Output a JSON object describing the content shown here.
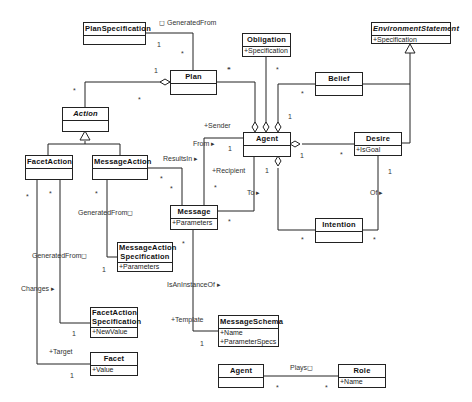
{
  "diagram": {
    "type": "UML class diagram",
    "classes": [
      {
        "id": "planspec",
        "name": "PlanSpecification",
        "attributes": [],
        "abstract": false
      },
      {
        "id": "plan",
        "name": "Plan",
        "attributes": [],
        "abstract": false
      },
      {
        "id": "obligation",
        "name": "Obligation",
        "attributes": [
          "+Specification"
        ],
        "abstract": false
      },
      {
        "id": "envstatement",
        "name": "EnvironmentStatement",
        "attributes": [
          "+Specification"
        ],
        "abstract": true
      },
      {
        "id": "action",
        "name": "Action",
        "attributes": [],
        "abstract": true
      },
      {
        "id": "belief",
        "name": "Belief",
        "attributes": [],
        "abstract": false
      },
      {
        "id": "agent",
        "name": "Agent",
        "attributes": [],
        "abstract": false
      },
      {
        "id": "desire",
        "name": "Desire",
        "attributes": [
          "+IsGoal"
        ],
        "abstract": false
      },
      {
        "id": "facetaction",
        "name": "FacetAction",
        "attributes": [],
        "abstract": false
      },
      {
        "id": "messageaction",
        "name": "MessageAction",
        "attributes": [],
        "abstract": false
      },
      {
        "id": "message",
        "name": "Message",
        "attributes": [
          "+Parameters"
        ],
        "abstract": false
      },
      {
        "id": "intention",
        "name": "Intention",
        "attributes": [],
        "abstract": false
      },
      {
        "id": "msgactionspec",
        "name": "MessageAction Specification",
        "name_lines": [
          "MessageAction",
          "Specification"
        ],
        "attributes": [
          "+Parameters"
        ],
        "abstract": false
      },
      {
        "id": "facetactionspec",
        "name": "FacetAction Specification",
        "name_lines": [
          "FacetAction",
          "Specification"
        ],
        "attributes": [
          "+NewValue"
        ],
        "abstract": false
      },
      {
        "id": "messageschema",
        "name": "MessageSchema",
        "attributes": [
          "+Name",
          "+ParameterSpecs"
        ],
        "abstract": false
      },
      {
        "id": "facet",
        "name": "Facet",
        "attributes": [
          "+Value"
        ],
        "abstract": false
      },
      {
        "id": "agent2",
        "name": "Agent",
        "attributes": [],
        "abstract": false
      },
      {
        "id": "role",
        "name": "Role",
        "attributes": [
          "+Name"
        ],
        "abstract": false
      }
    ],
    "labels": {
      "generated_from_plan": "◻ GeneratedFrom",
      "sender": "+Sender",
      "from": "From ▸",
      "results_in": "ResultsIn ▸",
      "recipient": "+Recipient",
      "to": "To ▸",
      "of": "Of ▸",
      "generated_from_msg": "GeneratedFrom◻",
      "generated_from_facet": "GeneratedFrom◻",
      "changes": "Changes ▸",
      "target": "+Target",
      "is_an_instance_of": "IsAnInstanceOf ▸",
      "template": "+Template",
      "plays": "Plays◻"
    },
    "multiplicities": {
      "planspec_1": "1",
      "plan_star_top": "*",
      "plan_1_left": "1",
      "plan_star_right": "*",
      "action_star": "*",
      "action_star2": "*",
      "obligation_star": "*",
      "obligation_star2": "*",
      "belief_star": "*",
      "agent_1_belief": "1",
      "agent_1_from": "1",
      "agent_1_desire": "1",
      "desire_star": "*",
      "desire_1_of": "1",
      "agent_1_intention": "1",
      "msg_star_recipient": "*",
      "msg_star_to": "*",
      "msg_star_resultsin": "*",
      "msgaction_star": "*",
      "msgaction_star2": "*",
      "facetaction_star": "*",
      "facetaction_star2": "*",
      "message_star": "*",
      "msgactionspec_1": "1",
      "intention_star_l": "*",
      "intention_star_r": "*",
      "facetactionspec_1": "1",
      "facet_1": "1",
      "messageschema_1": "1",
      "agent2_star": "*",
      "role_star": "*"
    }
  }
}
